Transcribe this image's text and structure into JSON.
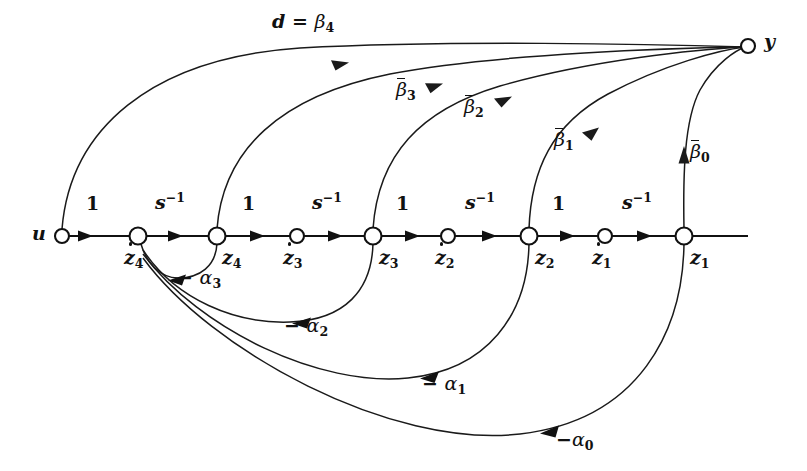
{
  "diagram": {
    "kind": "signal flow graph",
    "background_color": "#ffffff",
    "line_color": "#111111",
    "nodes": [
      {
        "id": "u",
        "label": "u",
        "x": 62,
        "y": 236,
        "label_x": 40,
        "label_y": 226
      },
      {
        "id": "zd4",
        "label": "z4",
        "x": 138,
        "y": 236,
        "label_x": 126,
        "label_y": 248
      },
      {
        "id": "z4",
        "label": "z4",
        "x": 217,
        "y": 236,
        "label_x": 224,
        "label_y": 248
      },
      {
        "id": "zd3",
        "label": "z3",
        "x": 297,
        "y": 236,
        "label_x": 285,
        "label_y": 248
      },
      {
        "id": "z3",
        "label": "z3",
        "x": 373,
        "y": 236,
        "label_x": 381,
        "label_y": 248
      },
      {
        "id": "zd2",
        "label": "z2",
        "x": 448,
        "y": 236,
        "label_x": 437,
        "label_y": 248
      },
      {
        "id": "z2",
        "label": "z2",
        "x": 529,
        "y": 236,
        "label_x": 537,
        "label_y": 248
      },
      {
        "id": "zd1",
        "label": "z1",
        "x": 605,
        "y": 236,
        "label_x": 594,
        "label_y": 248
      },
      {
        "id": "z1",
        "label": "z1",
        "x": 684,
        "y": 236,
        "label_x": 692,
        "label_y": 248
      },
      {
        "id": "y",
        "label": "y",
        "x": 748,
        "y": 46,
        "label_x": 766,
        "label_y": 33
      }
    ],
    "forward_gains": [
      {
        "from": "u",
        "to": "zd4",
        "label": "1",
        "x": 92,
        "y": 198
      },
      {
        "from": "zd4",
        "to": "z4",
        "label": "s-1",
        "x": 163,
        "y": 196
      },
      {
        "from": "z4",
        "to": "zd3",
        "label": "1",
        "x": 246,
        "y": 198
      },
      {
        "from": "zd3",
        "to": "z3",
        "label": "s-1",
        "x": 320,
        "y": 196
      },
      {
        "from": "z3",
        "to": "zd2",
        "label": "1",
        "x": 400,
        "y": 198
      },
      {
        "from": "zd2",
        "to": "z2",
        "label": "s-1",
        "x": 473,
        "y": 196
      },
      {
        "from": "z2",
        "to": "zd1",
        "label": "1",
        "x": 556,
        "y": 198
      },
      {
        "from": "zd1",
        "to": "z1",
        "label": "s-1",
        "x": 630,
        "y": 196
      }
    ],
    "feedforward_edges": [
      {
        "from": "u",
        "to": "y",
        "label": "d = b4",
        "label_x": 278,
        "label_y": 18,
        "bar": false
      },
      {
        "from": "z4",
        "to": "y",
        "label": "b3",
        "label_x": 401,
        "label_y": 84,
        "bar": true
      },
      {
        "from": "z3",
        "to": "y",
        "label": "b2",
        "label_x": 470,
        "label_y": 100,
        "bar": true
      },
      {
        "from": "z2",
        "to": "y",
        "label": "b1",
        "label_x": 558,
        "label_y": 133,
        "bar": true
      },
      {
        "from": "z1",
        "to": "y",
        "label": "b0",
        "label_x": 692,
        "label_y": 145,
        "bar": true
      }
    ],
    "feedback_edges": [
      {
        "from": "z4",
        "to": "zd4",
        "label": "- a3",
        "label_x": 183,
        "label_y": 272
      },
      {
        "from": "z3",
        "to": "zd4",
        "label": "- a2",
        "label_x": 290,
        "label_y": 320
      },
      {
        "from": "z2",
        "to": "zd4",
        "label": "- a1",
        "label_x": 428,
        "label_y": 378
      },
      {
        "from": "z1",
        "to": "zd4",
        "label": "- a0",
        "label_x": 560,
        "label_y": 434
      }
    ],
    "symbols": {
      "beta": "β",
      "alpha": "α",
      "minus": "−",
      "s": "s",
      "exponent_minus_one": "-1",
      "equals": "="
    }
  }
}
